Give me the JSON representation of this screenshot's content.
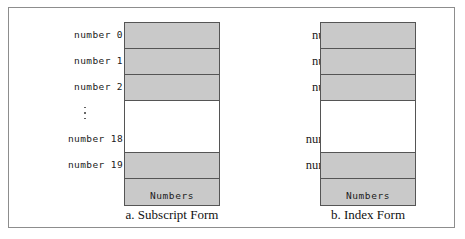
{
  "figure": {
    "border_color": "#8d8d8d",
    "cell_fill": "#c9c9c9",
    "cell_stroke": "#555555"
  },
  "panels": [
    {
      "id": "subscript",
      "caption": "a. Subscript Form",
      "box_caption": "Numbers",
      "labels": [
        "number 0",
        "number 1",
        "number 2",
        "",
        "number 18",
        "number 19"
      ],
      "ellipsis": "⋮"
    },
    {
      "id": "index",
      "caption": "b. Index Form",
      "box_caption": "Numbers",
      "labels": [
        "number [0]",
        "number [1]",
        "number [2]",
        "",
        "number [18]",
        "number [19]"
      ],
      "ellipsis": "⋮"
    }
  ],
  "cells": {
    "filled_top_count": 3,
    "gap_rows": 2,
    "filled_bottom_count": 2,
    "total_elements": 20
  }
}
